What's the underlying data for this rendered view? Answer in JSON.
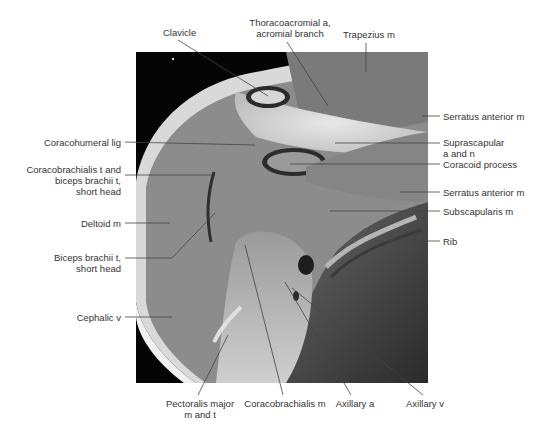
{
  "figure": {
    "type": "MRI coronal section of shoulder, labeled anatomy",
    "labels": {
      "clavicle": "Clavicle",
      "thoracoacromial_1": "Thoracoacromial a,",
      "thoracoacromial_2": "acromial branch",
      "trapezius": "Trapezius m",
      "serratus_anterior_upper": "Serratus anterior m",
      "suprascapular_1": "Suprascapular",
      "suprascapular_2": "a and n",
      "coracoid_process": "Coracoid process",
      "serratus_anterior_lower": "Serratus anterior m",
      "subscapularis": "Subscapularis m",
      "rib": "Rib",
      "coracohumeral_lig": "Coracohumeral lig",
      "coracobrachialis_t_1": "Coracobrachialis t and",
      "coracobrachialis_t_2": "biceps brachii t,",
      "coracobrachialis_t_3": "short head",
      "deltoid": "Deltoid m",
      "biceps_short_1": "Biceps brachii t,",
      "biceps_short_2": "short head",
      "cephalic_v": "Cephalic v",
      "pectoralis_1": "Pectoralis major",
      "pectoralis_2": "m and t",
      "coracobrachialis_m": "Coracobrachialis m",
      "axillary_a": "Axillary a",
      "axillary_v": "Axillary v"
    },
    "colors": {
      "background": "#ffffff",
      "label_text": "#333333",
      "leader_line": "#444444",
      "mri_black": "#050505",
      "muscle_gray": "#8a8a8a"
    }
  }
}
